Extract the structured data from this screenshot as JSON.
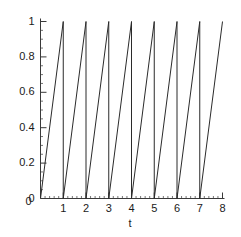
{
  "chart_data": {
    "type": "line",
    "title": "",
    "subtitle": "",
    "xlabel": "t",
    "ylabel": "",
    "xlim": [
      0,
      8
    ],
    "ylim": [
      0,
      1
    ],
    "grid": false,
    "legend": null,
    "legend_position": "none",
    "waveform": "sawtooth",
    "period": 1,
    "cycles": 8,
    "amplitude_min": 0,
    "amplitude_max": 1,
    "line_color": "#2b2b2b",
    "line_width": 1,
    "x_ticks": [
      0,
      1,
      2,
      3,
      4,
      5,
      6,
      7,
      8
    ],
    "x_tick_labels": [
      "0",
      "1",
      "2",
      "3",
      "4",
      "5",
      "6",
      "7",
      "8"
    ],
    "x_minor_tick_step": 0.2,
    "y_ticks": [
      0,
      0.2,
      0.4,
      0.6,
      0.8,
      1
    ],
    "y_tick_labels": [
      "0",
      "0.2",
      "0.4",
      "0.6",
      "0.8",
      "1"
    ],
    "y_minor_tick_step": 0.05,
    "series": [
      {
        "name": "sawtooth",
        "points": [
          [
            0.0,
            0.0
          ],
          [
            1.0,
            1.0
          ],
          [
            1.0,
            0.0
          ],
          [
            2.0,
            1.0
          ],
          [
            2.0,
            0.0
          ],
          [
            3.0,
            1.0
          ],
          [
            3.0,
            0.0
          ],
          [
            4.0,
            1.0
          ],
          [
            4.0,
            0.0
          ],
          [
            5.0,
            1.0
          ],
          [
            5.0,
            0.0
          ],
          [
            6.0,
            1.0
          ],
          [
            6.0,
            0.0
          ],
          [
            7.0,
            1.0
          ],
          [
            7.0,
            0.0
          ],
          [
            8.0,
            1.0
          ]
        ]
      }
    ]
  },
  "axes": {
    "x_axis_name": "t-axis",
    "y_axis_name": "value-axis"
  }
}
